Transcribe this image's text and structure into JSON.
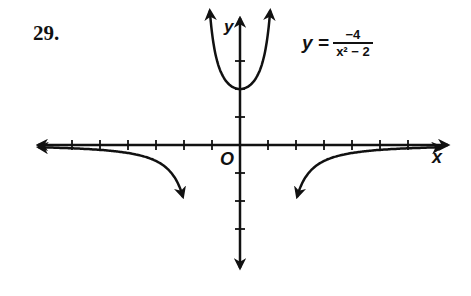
{
  "problem_number": "29.",
  "equation": {
    "lhs": "y =",
    "numerator": "−4",
    "denominator": "x² − 2"
  },
  "axes": {
    "x_label": "x",
    "y_label": "y",
    "origin_label": "O"
  },
  "chart_data": {
    "type": "line",
    "xlabel": "x",
    "ylabel": "y",
    "xlim": [
      -7,
      7
    ],
    "ylim": [
      -4.5,
      4.5
    ],
    "grid": false,
    "tick_spacing": 1,
    "asymptotes": {
      "vertical": [
        -1.414,
        1.414
      ],
      "horizontal": [
        0
      ]
    },
    "series": [
      {
        "name": "left branch",
        "x": [
          -7,
          -5,
          -4,
          -3,
          -2,
          -1.8
        ],
        "y": [
          -0.085,
          -0.174,
          -0.286,
          -0.571,
          -2.0,
          -3.226
        ]
      },
      {
        "name": "middle branch",
        "x": [
          -1.2,
          -1,
          -0.5,
          0,
          0.5,
          1,
          1.2
        ],
        "y": [
          7.14,
          4.0,
          2.29,
          2.0,
          2.29,
          4.0,
          7.14
        ]
      },
      {
        "name": "right branch",
        "x": [
          1.8,
          2,
          3,
          4,
          5,
          7
        ],
        "y": [
          -3.226,
          -2.0,
          -0.571,
          -0.286,
          -0.174,
          -0.085
        ]
      }
    ]
  }
}
